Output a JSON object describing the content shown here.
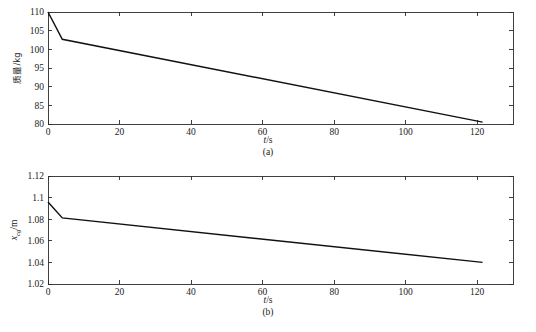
{
  "figure": {
    "background_color": "#ffffff",
    "line_color": "#111111",
    "axis_color": "#2b2b2b"
  },
  "chart_data": [
    {
      "id": "a",
      "type": "line",
      "title": "",
      "subtitle": "(a)",
      "xlabel": "t/s",
      "xlabel_symbol": "t",
      "xlabel_unit": "/s",
      "ylabel": "质量/kg",
      "ylabel_symbol": "质量",
      "ylabel_unit": "/kg",
      "xlim": [
        0,
        130
      ],
      "ylim": [
        80,
        110
      ],
      "xticks": [
        0,
        20,
        40,
        60,
        80,
        100,
        120
      ],
      "xticklabels": [
        "0",
        "20",
        "40",
        "60",
        "80",
        "100",
        "120"
      ],
      "yticks": [
        80,
        85,
        90,
        95,
        100,
        105,
        110
      ],
      "yticklabels": [
        "80",
        "85",
        "90",
        "95",
        "100",
        "105",
        "110"
      ],
      "grid": false,
      "legend": "none",
      "series": [
        {
          "name": "mass",
          "x": [
            0,
            4.0,
            121.5
          ],
          "y": [
            110.0,
            102.7,
            80.5
          ]
        }
      ]
    },
    {
      "id": "b",
      "type": "line",
      "title": "",
      "subtitle": "(b)",
      "xlabel": "t/s",
      "xlabel_symbol": "t",
      "xlabel_unit": "/s",
      "ylabel": "x_cg/m",
      "ylabel_symbol": "x",
      "ylabel_subscript": "cg",
      "ylabel_unit": "/m",
      "xlim": [
        0,
        130
      ],
      "ylim": [
        1.02,
        1.12
      ],
      "xticks": [
        0,
        20,
        40,
        60,
        80,
        100,
        120
      ],
      "xticklabels": [
        "0",
        "20",
        "40",
        "60",
        "80",
        "100",
        "120"
      ],
      "yticks": [
        1.02,
        1.04,
        1.06,
        1.08,
        1.1,
        1.12
      ],
      "yticklabels": [
        "1.02",
        "1.04",
        "1.06",
        "1.08",
        "1.1",
        "1.12"
      ],
      "grid": false,
      "legend": "none",
      "series": [
        {
          "name": "x_cg",
          "x": [
            0,
            4.0,
            121.5
          ],
          "y": [
            1.096,
            1.0812,
            1.04
          ]
        }
      ]
    }
  ]
}
